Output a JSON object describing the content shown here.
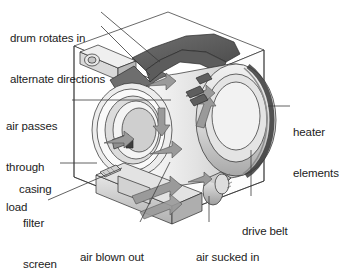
{
  "diagram": {
    "background_color": "#ffffff",
    "text_color": "#1c1c1c",
    "line_color": "#2a2a2a",
    "fill_light": "#e8e8e8",
    "fill_mid": "#bdbdbd",
    "fill_dark": "#6b6b6b",
    "fill_darker": "#4a4a4a",
    "arrow_color": "#9a9a9a"
  },
  "labels": {
    "drum_rotates": {
      "line1": "drum rotates in",
      "line2": "alternate directions"
    },
    "air_passes": {
      "line1": "air passes",
      "line2": "through",
      "line3": "load"
    },
    "casing": {
      "line1": "casing"
    },
    "filter_screen": {
      "line1": "filter",
      "line2": "screen"
    },
    "heater_elements": {
      "line1": "heater",
      "line2": "elements"
    },
    "drive_belt": {
      "line1": "drive belt"
    },
    "air_blown_out": {
      "line1": "air blown out"
    },
    "air_sucked_in": {
      "line1": "air sucked in"
    }
  }
}
